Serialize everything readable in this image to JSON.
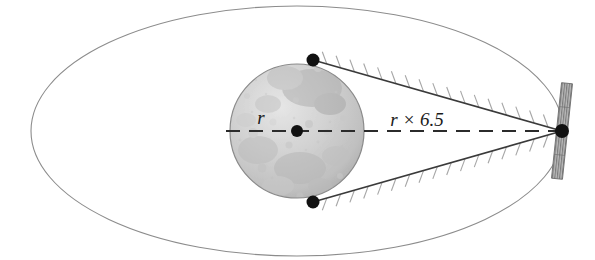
{
  "figure": {
    "type": "geometry-diagram",
    "background_color": "#ffffff"
  },
  "labels": {
    "radius": "r",
    "distance": "r × 6.5"
  },
  "colors": {
    "orbit_stroke": "#8c8c8c",
    "tangent_stroke": "#3a3a3a",
    "hatch_stroke": "#a6a6a6",
    "dash_stroke": "#2b2b2b",
    "dot_fill": "#111111",
    "body_light": "#dedede",
    "body_mid": "#c8c8c8",
    "body_dark": "#aeaeae",
    "body_edge": "#8a8a8a",
    "panel_fill": "#b4b4b4",
    "panel_stroke": "#6e6e6e",
    "text_color": "#1a1a1a"
  },
  "geometry": {
    "orbit_ellipse": {
      "cx": 297,
      "cy": 131,
      "rx": 266,
      "ry": 125
    },
    "body_circle": {
      "cx": 297,
      "cy": 131,
      "r": 67
    },
    "body_center_dot": {
      "cx": 297,
      "cy": 131,
      "r": 6
    },
    "tangent_point_upper": {
      "cx": 313,
      "cy": 60,
      "r": 6
    },
    "tangent_point_lower": {
      "cx": 313,
      "cy": 202,
      "r": 6
    },
    "satellite_center": {
      "cx": 562,
      "cy": 131,
      "r": 7
    },
    "dashed_axis": {
      "x1": 226,
      "y1": 131,
      "x2": 560,
      "y2": 131
    },
    "dash_pattern": "14 9",
    "radius_label_pos": {
      "x": 261,
      "y": 124
    },
    "distance_label_pos": {
      "x": 417,
      "y": 126
    },
    "solar_panel": {
      "width": 11,
      "height": 96,
      "tilt_deg": 6,
      "stripes": 9
    },
    "hatch_count_per_line": 18,
    "hatch_length": 13
  },
  "elements": {
    "orbit_name": "orbit-ellipse",
    "body_name": "planetary-body",
    "satellite_name": "satellite",
    "upper_tangent_name": "upper-tangent-line",
    "lower_tangent_name": "lower-tangent-line"
  }
}
